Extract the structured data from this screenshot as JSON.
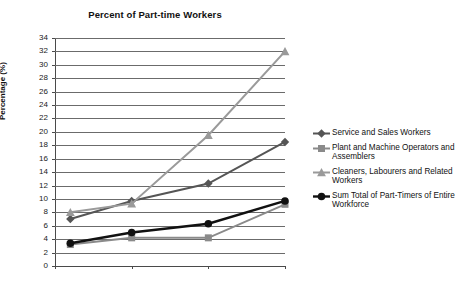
{
  "chart_data": {
    "type": "line",
    "title": "Percent of Part-time Workers",
    "xlabel": "",
    "ylabel": "Percentage (%)",
    "x": [
      1997,
      2001,
      2006,
      2011
    ],
    "xtick_labels": [
      "1996",
      "2001",
      "2006",
      "2011"
    ],
    "xlim": [
      1996,
      2011
    ],
    "ylim": [
      0,
      34
    ],
    "ytick_labels": [
      "0",
      "2",
      "4",
      "6",
      "8",
      "10",
      "12",
      "14",
      "16",
      "18",
      "20",
      "22",
      "24",
      "26",
      "28",
      "30",
      "32",
      "34"
    ],
    "ytick_values": [
      0,
      2,
      4,
      6,
      8,
      10,
      12,
      14,
      16,
      18,
      20,
      22,
      24,
      26,
      28,
      30,
      32,
      34
    ],
    "grid": true,
    "legend_position": "right",
    "series": [
      {
        "name": "Service and Sales Workers",
        "values": [
          7.0,
          9.7,
          12.3,
          18.5
        ],
        "marker": "diamond",
        "color": "#555555"
      },
      {
        "name": "Plant and Machine Operators and Assemblers",
        "values": [
          3.2,
          4.2,
          4.2,
          9.2
        ],
        "marker": "square",
        "color": "#8a8a8a"
      },
      {
        "name": "Cleaners, Labourers and Related Workers",
        "values": [
          8.0,
          9.3,
          19.5,
          32.0
        ],
        "marker": "triangle",
        "color": "#9a9a9a"
      },
      {
        "name": "Sum Total of Part-Timers of Entire Workforce",
        "values": [
          3.4,
          5.0,
          6.3,
          9.7
        ],
        "marker": "circle",
        "color": "#111111"
      }
    ]
  },
  "legend": {
    "items": [
      {
        "label": "Service and Sales Workers",
        "icon": "diamond-marker-icon"
      },
      {
        "label": "Plant and Machine Operators and Assemblers",
        "icon": "square-marker-icon"
      },
      {
        "label": "Cleaners, Labourers and Related Workers",
        "icon": "triangle-marker-icon"
      },
      {
        "label": "Sum Total of Part-Timers of Entire Workforce",
        "icon": "circle-marker-icon"
      }
    ]
  }
}
